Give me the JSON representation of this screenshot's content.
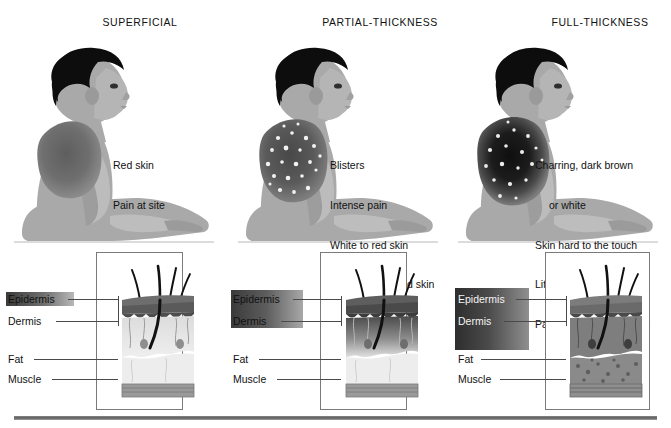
{
  "columns": [
    {
      "title": "SUPERFICIAL",
      "symptoms": [
        "Red skin",
        "Pain at site"
      ],
      "layers": [
        "Epidermis",
        "Dermis",
        "Fat",
        "Muscle"
      ],
      "burn_depth_label": "epidermis-only",
      "figure_alt": "seated child with reddened burn on back and shoulder"
    },
    {
      "title": "PARTIAL-THICKNESS",
      "symptoms": [
        "Blisters",
        "Intense pain",
        "White to red skin",
        "Moist and mottled skin"
      ],
      "layers": [
        "Epidermis",
        "Dermis",
        "Fat",
        "Muscle"
      ],
      "burn_depth_label": "epidermis-and-dermis",
      "figure_alt": "seated child with blistered mottled burn on back and shoulder"
    },
    {
      "title": "FULL-THICKNESS",
      "symptoms": [
        "Charring, dark brown",
        "or white",
        "Skin hard to the touch",
        "Little or no pain",
        "Pain at periphery of burn"
      ],
      "symptom_indent_index": 1,
      "layers": [
        "Epidermis",
        "Dermis",
        "Fat",
        "Muscle"
      ],
      "burn_depth_label": "full-depth-through-fat",
      "figure_alt": "seated child with charred black burn on back and shoulder"
    }
  ],
  "colors": {
    "skin": "#a9a9a9",
    "skin_shadow": "#8e8e8e",
    "hair": "#0d0d0d",
    "burn_superficial": "#6f6f6f",
    "burn_partial": "#5a5a5a",
    "burn_full": "#1c1c1c",
    "blister": "#f2f2f2",
    "epidermis": "#5a5a5a",
    "dermis": "#cfcfcf",
    "fat": "#e2e2e2",
    "muscle": "#9a9a9a",
    "panel_border": "#7a7a7a",
    "leader": "#4a4a4a",
    "rule": "#5d5d5d",
    "text": "#111111"
  }
}
